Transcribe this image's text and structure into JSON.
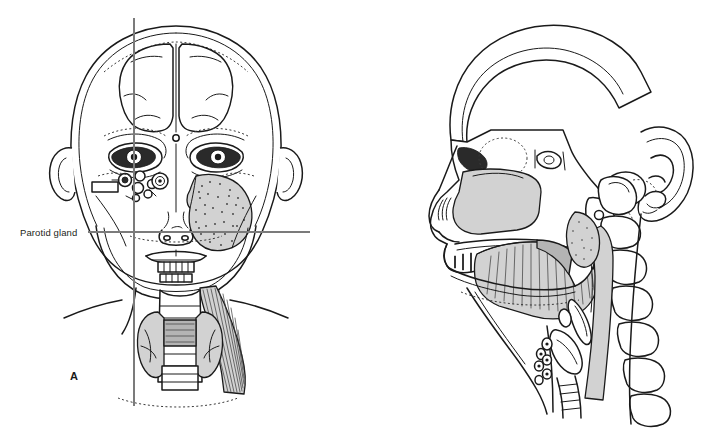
{
  "figure": {
    "type": "anatomical-illustration",
    "background_color": "#ffffff",
    "ink_color": "#1a1a1a",
    "crosshair_color": "#7b7b7b",
    "panels": [
      {
        "id": "A",
        "label": "A",
        "view": "anterior (AP) view of head and neck",
        "callout": {
          "label": "Parotid gland",
          "leader_line": true
        },
        "crosshair": {
          "vertical": true,
          "horizontal": true
        },
        "structures": [
          "cranial vault",
          "frontal sinus",
          "orbit",
          "globe",
          "ethmoid air cells",
          "maxillary sinus",
          "nasal cavity",
          "mandible",
          "teeth",
          "parotid gland",
          "sternocleidomastoid muscle",
          "thyroid gland",
          "trachea",
          "clavicle"
        ]
      },
      {
        "id": "B",
        "label": "B",
        "view": "lateral (sagittal) view of head and neck",
        "callout": {
          "label": "Parotid gland",
          "leader_line": true
        },
        "crosshair": {
          "vertical": true,
          "horizontal": true
        },
        "structures": [
          "calvarium",
          "frontal sinus",
          "sphenoid sinus",
          "sella turcica",
          "nasal cavity",
          "hard palate",
          "tongue",
          "soft palate",
          "oropharynx",
          "mandible",
          "auricle",
          "external auditory canal",
          "parotid gland",
          "cervical vertebrae",
          "epiglottis",
          "hyoid bone",
          "larynx",
          "trachea",
          "thyroid gland"
        ]
      }
    ]
  }
}
